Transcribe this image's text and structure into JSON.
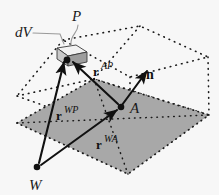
{
  "figure": {
    "background_color": "#f7f7f7",
    "plane_fill": "#a8a8a8",
    "dotted_color": "#1a1a1a",
    "arrow_color": "#111111",
    "leader_color": "#808080"
  },
  "points": [
    {
      "id": "P",
      "label": "P",
      "x": 67,
      "y": 60,
      "label_x": 76,
      "label_y": 20
    },
    {
      "id": "A",
      "label": "A",
      "x": 121,
      "y": 107,
      "label_x": 131,
      "label_y": 112
    },
    {
      "id": "W",
      "label": "W",
      "x": 37,
      "y": 167,
      "label_x": 31,
      "label_y": 188
    }
  ],
  "labels": {
    "dV": "dV",
    "P": "P",
    "A": "A",
    "W": "W",
    "n": "n"
  },
  "vectors": [
    {
      "id": "r_AP",
      "base": "r",
      "superscript": "AP",
      "from": "A",
      "to": "P",
      "label_x": 96,
      "label_y": 72
    },
    {
      "id": "r_WP",
      "base": "r",
      "superscript": "WP",
      "from": "W",
      "to": "P",
      "label_x": 60,
      "label_y": 116
    },
    {
      "id": "r_WA",
      "base": "r",
      "superscript": "WA",
      "from": "W",
      "to": "A",
      "label_x": 100,
      "label_y": 145
    },
    {
      "id": "n",
      "base": "n",
      "superscript": "",
      "from": "A",
      "to": "normal-tip",
      "label_x": 149,
      "label_y": 76
    }
  ],
  "elements": {
    "volume_element_label": "dV",
    "surface_plane_name": "shaded-surface",
    "bounding_box_name": "dotted-volume-box"
  }
}
